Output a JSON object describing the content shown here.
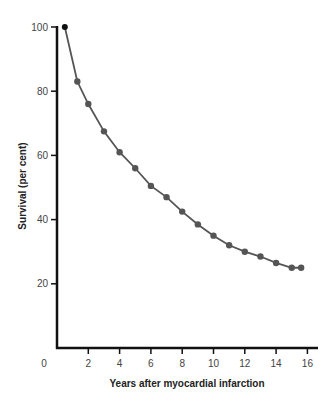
{
  "chart_data": {
    "type": "line",
    "title": "",
    "xlabel": "Years after myocardial infarction",
    "ylabel": "Survival (per cent)",
    "xlim": [
      0,
      16.5
    ],
    "ylim": [
      0,
      100
    ],
    "grid": false,
    "legend": null,
    "x_ticks": [
      0,
      2,
      4,
      6,
      8,
      10,
      12,
      14,
      16
    ],
    "x_tick_labels": [
      "0",
      "2",
      "4",
      "6",
      "8",
      "10",
      "12",
      "14",
      "16"
    ],
    "y_ticks": [
      20,
      40,
      60,
      80,
      100
    ],
    "y_tick_labels": [
      "20",
      "40",
      "60",
      "80",
      "100"
    ],
    "series": [
      {
        "name": "Survival",
        "color": "#555555",
        "x": [
          0.5,
          1.3,
          2.0,
          3.0,
          4.0,
          5.0,
          6.0,
          7.0,
          8.0,
          9.0,
          10.0,
          11.0,
          12.0,
          13.0,
          14.0,
          15.0,
          15.6
        ],
        "y": [
          100,
          83,
          76,
          67.5,
          61,
          56,
          50.5,
          47,
          42.5,
          38.5,
          35,
          32,
          30,
          28.5,
          26.5,
          25,
          25
        ]
      }
    ]
  },
  "labels": {
    "xlabel": "Years after myocardial infarction",
    "ylabel": "Survival (per cent)",
    "origin": "0"
  }
}
